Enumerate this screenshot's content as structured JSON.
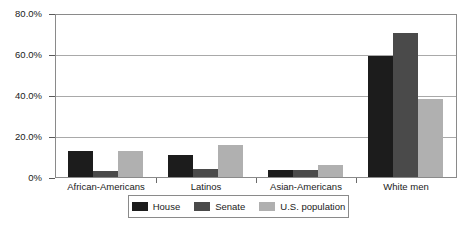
{
  "chart_data": {
    "type": "bar",
    "title": "",
    "subtitle": "",
    "xlabel": "",
    "ylabel": "",
    "categories": [
      "African-Americans",
      "Latinos",
      "Asian-Americans",
      "White men"
    ],
    "series": [
      {
        "name": "House",
        "color": "#1c1c1c",
        "values": [
          12.8,
          11.0,
          3.5,
          60.0
        ]
      },
      {
        "name": "Senate",
        "color": "#4a4a4a",
        "values": [
          3.0,
          4.0,
          3.5,
          71.0
        ]
      },
      {
        "name": "U.S. population",
        "color": "#b0b0b0",
        "values": [
          12.8,
          16.0,
          6.0,
          38.5
        ]
      }
    ],
    "ylim": [
      0,
      80
    ],
    "ytick_values": [
      0,
      20,
      40,
      60,
      80
    ],
    "ytick_labels": [
      "0%",
      "20.0%",
      "40.0%",
      "60.0%",
      "80.0%"
    ],
    "grid": true,
    "grid_axis": "y",
    "legend_position": "bottom",
    "legend_entries": [
      "House",
      "Senate",
      "U.S. population"
    ]
  }
}
